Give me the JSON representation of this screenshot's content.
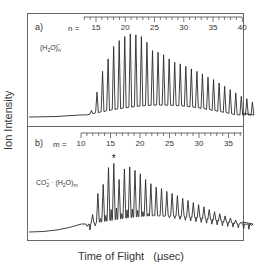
{
  "chart_data": [
    {
      "type": "line",
      "panel_label": "a)",
      "species_label": "(H2O)n−",
      "index_label": "n =",
      "axis": {
        "name": "n",
        "range": [
          13,
          43
        ],
        "major_ticks": [
          15,
          20,
          25,
          30,
          35,
          40
        ],
        "minor_step": 1
      },
      "peaks": {
        "x": [
          13,
          14,
          15,
          16,
          17,
          18,
          19,
          20,
          21,
          22,
          23,
          24,
          25,
          26,
          27,
          28,
          29,
          30,
          31,
          32,
          33,
          34,
          35,
          36,
          37,
          38,
          39,
          40,
          41,
          42,
          43
        ],
        "values": [
          3,
          8,
          30,
          55,
          70,
          85,
          92,
          97,
          100,
          99,
          97,
          90,
          80,
          78,
          75,
          70,
          66,
          64,
          61,
          58,
          55,
          52,
          48,
          45,
          41,
          37,
          33,
          29,
          25,
          22,
          18
        ]
      },
      "baseline": "flat from left edge, rising near n=13",
      "xlabel": "",
      "ylabel": "Ion Intensity"
    },
    {
      "type": "line",
      "panel_label": "b)",
      "species_label": "CO2− · (H2O)m",
      "index_label": "m =",
      "axis": {
        "name": "m",
        "range": [
          10,
          42
        ],
        "major_ticks": [
          10,
          15,
          20,
          25,
          30,
          35,
          40
        ],
        "minor_step": 1
      },
      "peaks": {
        "x": [
          11,
          12,
          13,
          14,
          15,
          16,
          17,
          18,
          19,
          20,
          21,
          22,
          23,
          24,
          25,
          26,
          27,
          28,
          29,
          30,
          31,
          32,
          33,
          34,
          35,
          36,
          37,
          38,
          39,
          40,
          41,
          42
        ],
        "values": [
          8,
          25,
          55,
          68,
          92,
          98,
          75,
          90,
          93,
          88,
          83,
          75,
          69,
          64,
          62,
          58,
          55,
          52,
          48,
          45,
          42,
          39,
          36,
          32,
          29,
          26,
          23,
          20,
          17,
          14,
          11,
          9
        ],
        "secondary_peak_fraction": 0.35
      },
      "annotations": [
        {
          "text": "*",
          "at": 16
        }
      ],
      "baseline": "slowly rising from left edge",
      "xlabel": "Time of Flight  (μsec)",
      "ylabel": "Ion Intensity"
    }
  ],
  "labels": {
    "ylabel": "Ion Intensity",
    "xlabel_main": "Time of Flight",
    "xlabel_unit": "(μsec)"
  },
  "colors": {
    "line": "#2a2a2a",
    "frame": "#555555",
    "text": "#333333"
  }
}
